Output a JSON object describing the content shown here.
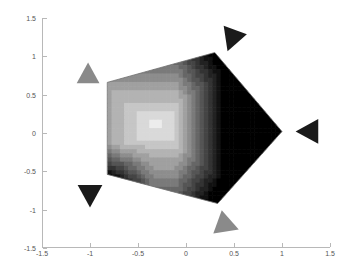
{
  "figure": {
    "title": "",
    "background": "#ffffff",
    "width": 346,
    "height": 276
  },
  "axes": {
    "x_label": "",
    "y_label": "",
    "axis_color": "#b8b8b8",
    "tick_label_color": "#555555",
    "box": false,
    "grid": false,
    "xlim": [
      -1.5,
      1.5
    ],
    "ylim": [
      -1.5,
      1.5
    ],
    "x_ticks": [
      -1.5,
      -1,
      -0.5,
      0,
      0.5,
      1,
      1.5
    ],
    "x_tick_labels": [
      "-1.5",
      "-1",
      "-0.5",
      "0",
      "0.5",
      "1",
      "1.5"
    ],
    "y_ticks": [
      -1.5,
      -1,
      -0.5,
      0,
      0.5,
      1,
      1.5
    ],
    "y_tick_labels": [
      "-1.5",
      "-1",
      "-0.5",
      "0",
      "0.5",
      "1",
      "1.5"
    ]
  },
  "chart_data": {
    "type": "heatmap",
    "title": "",
    "xlabel": "",
    "ylabel": "",
    "xlim": [
      -1.5,
      1.5
    ],
    "ylim": [
      -1.5,
      1.5
    ],
    "grid": false,
    "legend": "none",
    "colormap": "gray",
    "region": {
      "name": "pentagon-region",
      "vertices": [
        {
          "x": -0.82,
          "y": 0.66
        },
        {
          "x": 0.3,
          "y": 1.05
        },
        {
          "x": 1.0,
          "y": 0.02
        },
        {
          "x": 0.33,
          "y": -0.92
        },
        {
          "x": -0.82,
          "y": -0.54
        }
      ],
      "edge_color": "#707070"
    },
    "field": {
      "bright_center": {
        "x": -0.3,
        "y": 0.1
      },
      "value_range": [
        0.0,
        1.0
      ],
      "n_levels": 14,
      "level_values": [
        0.0,
        0.08,
        0.15,
        0.23,
        0.31,
        0.38,
        0.46,
        0.54,
        0.62,
        0.69,
        0.77,
        0.85,
        0.92,
        1.0
      ],
      "level_colors": [
        "#000000",
        "#111111",
        "#222222",
        "#333333",
        "#444444",
        "#555555",
        "#666666",
        "#7a7a7a",
        "#8d8d8d",
        "#a0a0a0",
        "#b3b3b3",
        "#c6c6c6",
        "#d9d9d9",
        "#ececec"
      ]
    },
    "markers": [
      {
        "name": "marker-top",
        "x": 0.48,
        "y": 1.23,
        "direction": "left-down",
        "rotation": 200,
        "color": "#1a1a1a",
        "size": 26
      },
      {
        "name": "marker-upper-left",
        "x": -1.02,
        "y": 0.76,
        "direction": "up",
        "rotation": 0,
        "color": "#8a8a8a",
        "size": 24
      },
      {
        "name": "marker-right",
        "x": 1.28,
        "y": 0.02,
        "direction": "left",
        "rotation": 270,
        "color": "#1a1a1a",
        "size": 26
      },
      {
        "name": "marker-lower-left",
        "x": -1.0,
        "y": -0.8,
        "direction": "down",
        "rotation": 180,
        "color": "#1a1a1a",
        "size": 26
      },
      {
        "name": "marker-bottom",
        "x": 0.42,
        "y": -1.2,
        "direction": "right-up",
        "rotation": 110,
        "color": "#8a8a8a",
        "size": 26
      }
    ]
  }
}
